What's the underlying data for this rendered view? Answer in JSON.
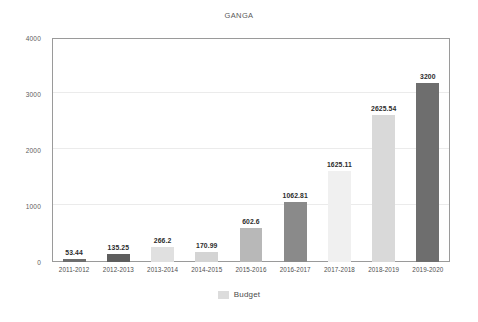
{
  "chart_data": {
    "type": "bar",
    "title": "GANGA",
    "xlabel": "",
    "ylabel": "",
    "ylim": [
      0,
      4000
    ],
    "yticks": [
      0,
      1000,
      2000,
      3000,
      4000
    ],
    "ytick_labels": [
      "0",
      "1000",
      "2000",
      "3000",
      "4000"
    ],
    "grid": true,
    "legend": {
      "position": "bottom",
      "entries": [
        {
          "label": "Budget",
          "color": "#dcdcdc"
        }
      ]
    },
    "categories": [
      "2011-2012",
      "2012-2013",
      "2013-2014",
      "2014-2015",
      "2015-2016",
      "2016-2017",
      "2017-2018",
      "2018-2019",
      "2019-2020"
    ],
    "values": [
      53.44,
      135.25,
      266.2,
      170.99,
      602.6,
      1062.81,
      1625.11,
      2625.54,
      3200
    ],
    "value_labels": [
      "53.44",
      "135.25",
      "266.2",
      "170.99",
      "602.6",
      "1062.81",
      "1625.11",
      "2625.54",
      "3200"
    ],
    "bar_colors": [
      "#6e6e6e",
      "#5e5e5e",
      "#e0e0e0",
      "#d4d4d4",
      "#b8b8b8",
      "#8a8a8a",
      "#f0f0f0",
      "#d9d9d9",
      "#6e6e6e"
    ],
    "series": [
      {
        "name": "Budget",
        "values": [
          53.44,
          135.25,
          266.2,
          170.99,
          602.6,
          1062.81,
          1625.11,
          2625.54,
          3200
        ]
      }
    ]
  },
  "colors": {
    "background": "#ffffff",
    "axis": "#9a9a9a",
    "gridline": "#ebebeb",
    "text": "#4f4f4f",
    "value_text": "#2c2c2c"
  }
}
